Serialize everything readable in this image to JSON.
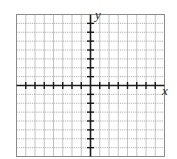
{
  "diagram": {
    "type": "coordinate-plane",
    "axes": {
      "x_label": "x",
      "y_label": "y"
    },
    "grid": {
      "columns": 16,
      "rows": 16,
      "origin_col": 8,
      "origin_row": 8,
      "x_ticks": [
        -7,
        -6,
        -5,
        -4,
        -3,
        -2,
        -1,
        1,
        2,
        3,
        4,
        5,
        6,
        7
      ],
      "y_ticks": [
        -7,
        -6,
        -5,
        -4,
        -3,
        -2,
        -1,
        1,
        2,
        3,
        4,
        5,
        6,
        7
      ]
    },
    "colors": {
      "border": "#8a8a8a",
      "grid_line": "#b5b5b5",
      "grid_dotted": "#9a9a9a",
      "axis": "#1a1a1a",
      "background": "#ffffff"
    }
  }
}
